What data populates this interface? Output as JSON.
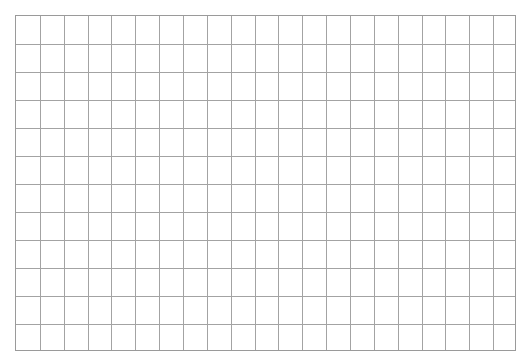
{
  "grid": {
    "columns": 21,
    "rows": 12,
    "line_color": "#a3a3a3",
    "border_color": "#9a9a9a",
    "background": "#ffffff"
  }
}
